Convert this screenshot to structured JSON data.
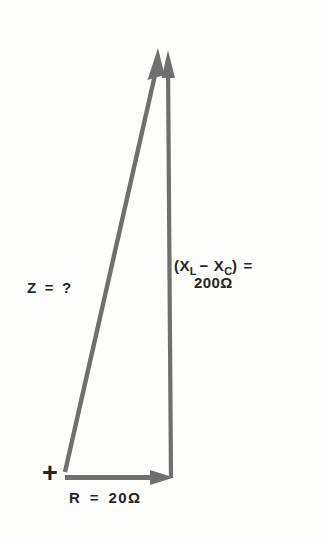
{
  "canvas": {
    "width": 325,
    "height": 540,
    "background_color": "#fdfdfc",
    "stroke_color": "#6f6f6f",
    "text_color": "#262626"
  },
  "diagram": {
    "type": "impedance-phasor-triangle",
    "origin_marker": "+",
    "vectors": [
      {
        "name": "resistance",
        "label": "R",
        "equals": "=",
        "value": "20",
        "unit": "Ω",
        "full_label": "R = 20Ω",
        "direction": "horizontal-right",
        "start": [
          65,
          477
        ],
        "end": [
          174,
          477
        ],
        "arrowhead": true
      },
      {
        "name": "net-reactance",
        "label_main": "(X",
        "sub_l": "L",
        "minus": "−",
        "label_second": "X",
        "sub_c": "C",
        "close_paren": ")",
        "equals": "=",
        "value": "200",
        "unit": "Ω",
        "full_label": "(X_L − X_C) = 200 Ω",
        "direction": "vertical-up",
        "start": [
          170,
          477
        ],
        "end": [
          168,
          50
        ],
        "arrowhead": true
      },
      {
        "name": "impedance",
        "label": "Z",
        "equals": "=",
        "value": "?",
        "full_label": "Z = ?",
        "direction": "diagonal-up-right",
        "start": [
          65,
          472
        ],
        "end": [
          158,
          48
        ],
        "arrowhead": true
      }
    ]
  },
  "labels": {
    "impedance": {
      "symbol": "Z",
      "equals": "=",
      "value": "?"
    },
    "reactance": {
      "open_paren": "(X",
      "sub_l": "L",
      "minus": "−",
      "x_symbol": "X",
      "sub_c": "C",
      "close_paren": ")",
      "equals": "=",
      "magnitude": "200",
      "ohm": "Ω"
    },
    "resistance": {
      "symbol": "R",
      "equals": "=",
      "value": "20",
      "ohm": "Ω"
    },
    "origin": {
      "marker": "+"
    }
  }
}
